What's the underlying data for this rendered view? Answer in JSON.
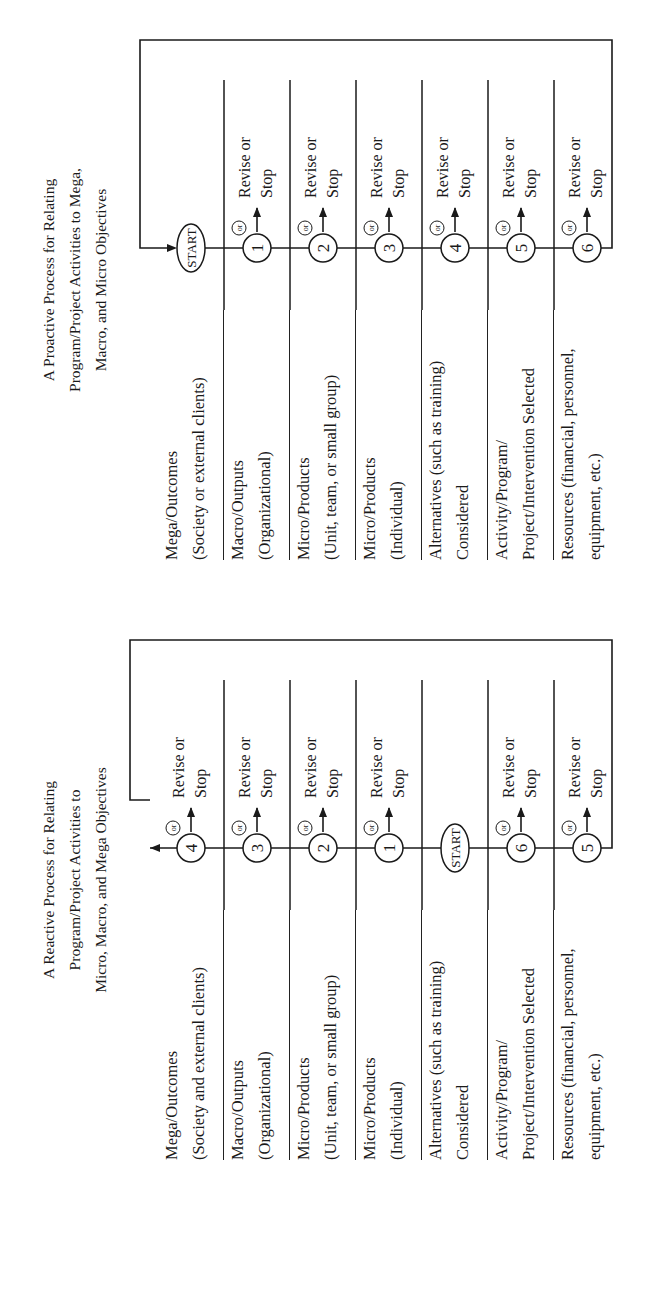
{
  "figure": {
    "orientation": "rotated 90 degrees counter-clockwise",
    "revise_label_line1": "Revise or",
    "revise_label_line2": "Stop",
    "or_label": "or",
    "start_label": "START"
  },
  "reactive": {
    "title_lines": [
      "A Reactive Process for Relating",
      "Program/Project Activities to",
      "Micro, Macro, and Mega Objectives"
    ],
    "levels": [
      {
        "line1": "Mega/Outcomes",
        "line2": "(Society and external clients)",
        "step": "4"
      },
      {
        "line1": "Macro/Outputs",
        "line2": "(Organizational)",
        "step": "3"
      },
      {
        "line1": "Micro/Products",
        "line2": "(Unit, team, or small group)",
        "step": "2"
      },
      {
        "line1": "Micro/Products",
        "line2": "(Individual)",
        "step": "1"
      },
      {
        "line1": "Alternatives (such as training)",
        "line2": "Considered",
        "step": "START"
      },
      {
        "line1": "Activity/Program/",
        "line2": "Project/Intervention Selected",
        "step": "6"
      },
      {
        "line1": "Resources (financial, personnel,",
        "line2": "equipment, etc.)",
        "step": "5"
      }
    ]
  },
  "proactive": {
    "title_lines": [
      "A Proactive Process for Relating",
      "Program/Project Activities to Mega,",
      "Macro, and Micro Objectives"
    ],
    "levels": [
      {
        "line1": "Mega/Outcomes",
        "line2": "(Society or external clients)",
        "step": "START"
      },
      {
        "line1": "Macro/Outputs",
        "line2": "(Organizational)",
        "step": "1"
      },
      {
        "line1": "Micro/Products",
        "line2": "(Unit, team, or small group)",
        "step": "2"
      },
      {
        "line1": "Micro/Products",
        "line2": "(Individual)",
        "step": "3"
      },
      {
        "line1": "Alternatives (such as training)",
        "line2": "Considered",
        "step": "4"
      },
      {
        "line1": "Activity/Program/",
        "line2": "Project/Intervention Selected",
        "step": "5"
      },
      {
        "line1": "Resources (financial, personnel,",
        "line2": "equipment, etc.)",
        "step": "6"
      }
    ]
  },
  "colors": {
    "ink": "#1a1a1a",
    "background": "#ffffff"
  }
}
